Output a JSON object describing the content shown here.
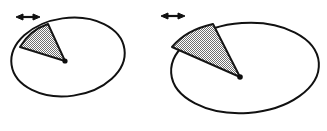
{
  "figure": {
    "background_color": "#ffffff",
    "width": 327,
    "height": 131,
    "stroke_color": "#111111",
    "shade_color": "#9a9a9a",
    "shade_pattern": "checkerboard-stipple"
  },
  "panels": [
    {
      "id": "left-panel",
      "name": "small-ellipse-panel",
      "ellipse": {
        "name": "small-ellipse",
        "center_x": 68,
        "center_y": 57,
        "radius_x": 57,
        "radius_y": 39,
        "rotation_deg": -8,
        "stroke_width": 2.0
      },
      "wedge": {
        "name": "small-shaded-sector",
        "apex_x": 65,
        "apex_y": 61,
        "edge1_x": 20,
        "edge1_y": 47,
        "arc_x": 48,
        "arc_y": 24,
        "fill": "#9e9e9e",
        "stroke_width": 2.0,
        "opening_label": "narrow-sector"
      },
      "vertex_dot": {
        "name": "small-ellipse-center-dot",
        "x": 65,
        "y": 61,
        "radius": 2.6
      },
      "arrow": {
        "name": "double-headed-arrow",
        "x1": 18,
        "x2": 38,
        "y": 17,
        "style": "double-headed-horizontal",
        "stroke_width": 1.6
      }
    },
    {
      "id": "right-panel",
      "name": "large-ellipse-panel",
      "ellipse": {
        "name": "large-ellipse",
        "center_x": 245,
        "center_y": 68,
        "radius_x": 74,
        "radius_y": 45,
        "rotation_deg": -4,
        "stroke_width": 2.0
      },
      "wedge": {
        "name": "large-shaded-sector",
        "apex_x": 240,
        "apex_y": 77,
        "edge1_x": 172,
        "edge1_y": 47,
        "arc_x": 213,
        "arc_y": 24,
        "fill": "#9e9e9e",
        "stroke_width": 2.0,
        "opening_label": "wide-sector"
      },
      "vertex_dot": {
        "name": "large-ellipse-center-dot",
        "x": 240,
        "y": 77,
        "radius": 2.8
      },
      "arrow": {
        "name": "double-headed-arrow",
        "x1": 163,
        "x2": 183,
        "y": 16,
        "style": "double-headed-horizontal",
        "stroke_width": 1.6
      }
    }
  ]
}
